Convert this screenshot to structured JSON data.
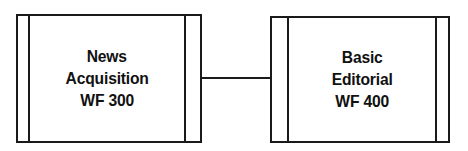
{
  "diagram": {
    "background_color": "#ffffff",
    "stroke_color": "#1a1a1a",
    "text_color": "#111111",
    "nodes": [
      {
        "id": "news-acquisition",
        "shape": "predefined-process",
        "lines": [
          "News",
          "Acquisition",
          "WF 300"
        ],
        "label": "News Acquisition WF 300",
        "workflow_code": "WF 300"
      },
      {
        "id": "basic-editorial",
        "shape": "predefined-process",
        "lines": [
          "Basic",
          "Editorial",
          "WF 400"
        ],
        "label": "Basic Editorial WF 400",
        "workflow_code": "WF 400"
      }
    ],
    "connectors": [
      {
        "id": "link-news-to-editorial",
        "from": "news-acquisition",
        "to": "basic-editorial",
        "style": "plain-line",
        "arrowhead": "none"
      }
    ]
  }
}
